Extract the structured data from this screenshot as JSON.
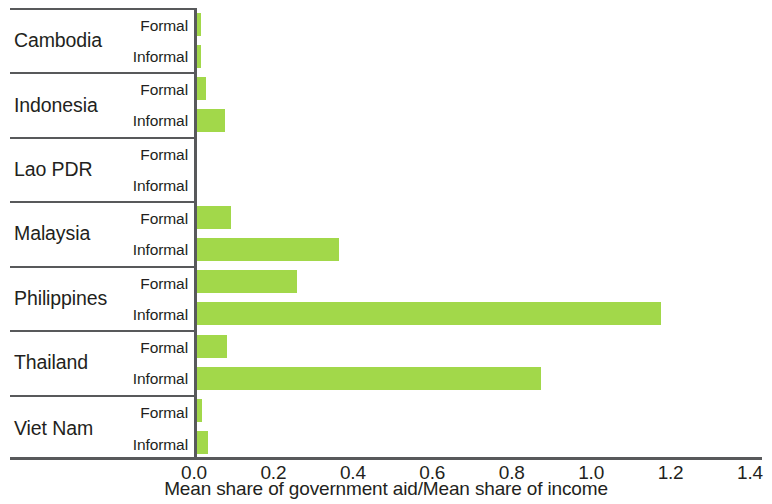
{
  "chart_data": {
    "type": "bar",
    "orientation": "horizontal",
    "title": "",
    "subtitle": "",
    "xlabel": "Mean share of government aid/Mean share of income",
    "ylabel": "",
    "xlim": [
      0.0,
      1.4
    ],
    "xticks": [
      "0.0",
      "0.2",
      "0.4",
      "0.6",
      "0.8",
      "1.0",
      "1.2",
      "1.4"
    ],
    "xtick_values": [
      0.0,
      0.2,
      0.4,
      0.6,
      0.8,
      1.0,
      1.2,
      1.4
    ],
    "grid": false,
    "legend": "none",
    "bar_color": "#a2d84a",
    "axis_color": "#58595b",
    "categories": [
      "Cambodia",
      "Indonesia",
      "Lao PDR",
      "Malaysia",
      "Philippines",
      "Thailand",
      "Viet Nam"
    ],
    "subcategories": [
      "Formal",
      "Informal"
    ],
    "series": [
      {
        "name": "Formal",
        "values": [
          0.012,
          0.025,
          0.0,
          0.088,
          0.253,
          0.078,
          0.015
        ]
      },
      {
        "name": "Informal",
        "values": [
          0.012,
          0.073,
          0.0,
          0.358,
          1.17,
          0.868,
          0.028
        ]
      }
    ],
    "groups": [
      {
        "country": "Cambodia",
        "rows": [
          {
            "label": "Formal",
            "value": 0.012
          },
          {
            "label": "Informal",
            "value": 0.012
          }
        ]
      },
      {
        "country": "Indonesia",
        "rows": [
          {
            "label": "Formal",
            "value": 0.025
          },
          {
            "label": "Informal",
            "value": 0.073
          }
        ]
      },
      {
        "country": "Lao PDR",
        "rows": [
          {
            "label": "Formal",
            "value": 0.0
          },
          {
            "label": "Informal",
            "value": 0.0
          }
        ]
      },
      {
        "country": "Malaysia",
        "rows": [
          {
            "label": "Formal",
            "value": 0.088
          },
          {
            "label": "Informal",
            "value": 0.358
          }
        ]
      },
      {
        "country": "Philippines",
        "rows": [
          {
            "label": "Formal",
            "value": 0.253
          },
          {
            "label": "Informal",
            "value": 1.17
          }
        ]
      },
      {
        "country": "Thailand",
        "rows": [
          {
            "label": "Formal",
            "value": 0.078
          },
          {
            "label": "Informal",
            "value": 0.868
          }
        ]
      },
      {
        "country": "Viet Nam",
        "rows": [
          {
            "label": "Formal",
            "value": 0.015
          },
          {
            "label": "Informal",
            "value": 0.028
          }
        ]
      }
    ]
  }
}
